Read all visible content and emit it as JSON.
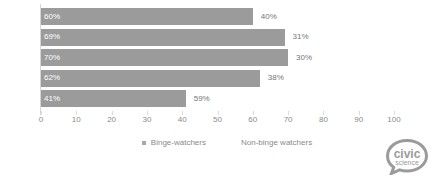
{
  "chart_data": {
    "type": "bar",
    "orientation": "horizontal",
    "stacked": true,
    "title": "",
    "subtitle": "",
    "xlabel": "",
    "ylabel": "",
    "xlim": [
      0,
      100
    ],
    "xticks": [
      0,
      10,
      20,
      30,
      40,
      50,
      60,
      70,
      80,
      90,
      100
    ],
    "xtick_labels": [
      "0",
      "10",
      "20",
      "30",
      "40",
      "50",
      "60",
      "70",
      "80",
      "90",
      "100"
    ],
    "grid": false,
    "legend_position": "bottom",
    "categories": [
      "13-17",
      "18-29",
      "30-44",
      "45-64",
      "65+"
    ],
    "series": [
      {
        "name": "Binge-watchers",
        "color": "#9b9b9b",
        "values": [
          60,
          69,
          70,
          62,
          41
        ],
        "labels": [
          "60%",
          "69%",
          "70%",
          "62%",
          "41%"
        ],
        "label_position": "inside",
        "label_color": "#ffffff"
      },
      {
        "name": "Non-binge watchers",
        "color": "#ffffff",
        "values": [
          40,
          31,
          30,
          38,
          59
        ],
        "labels": [
          "40%",
          "31%",
          "30%",
          "38%",
          "59%"
        ],
        "label_position": "outside",
        "label_color": "#767676"
      }
    ],
    "bars": [
      {
        "category": "13-17",
        "binge": 60,
        "binge_label": "60%",
        "nonbinge": 40,
        "nonbinge_label": "40%"
      },
      {
        "category": "18-29",
        "binge": 69,
        "binge_label": "69%",
        "nonbinge": 31,
        "nonbinge_label": "31%"
      },
      {
        "category": "30-44",
        "binge": 70,
        "binge_label": "70%",
        "nonbinge": 30,
        "nonbinge_label": "30%"
      },
      {
        "category": "45-64",
        "binge": 62,
        "binge_label": "62%",
        "nonbinge": 38,
        "nonbinge_label": "38%"
      },
      {
        "category": "65+",
        "binge": 41,
        "binge_label": "41%",
        "nonbinge": 59,
        "nonbinge_label": "59%"
      }
    ]
  },
  "legend": {
    "items": [
      {
        "label": "Binge-watchers",
        "color": "#a8a8a8",
        "has_swatch": true
      },
      {
        "label": "Non-binge watchers",
        "color": "#ffffff",
        "has_swatch": false
      }
    ]
  },
  "logo": {
    "line1": "civic",
    "line2": "science",
    "color": "#9b9b9b"
  },
  "colors": {
    "bar": "#9b9b9b",
    "axis": "#d6d6d6",
    "text": "#8a8a8a",
    "label_inside": "#ffffff",
    "label_outside": "#767676",
    "background": "#ffffff"
  }
}
